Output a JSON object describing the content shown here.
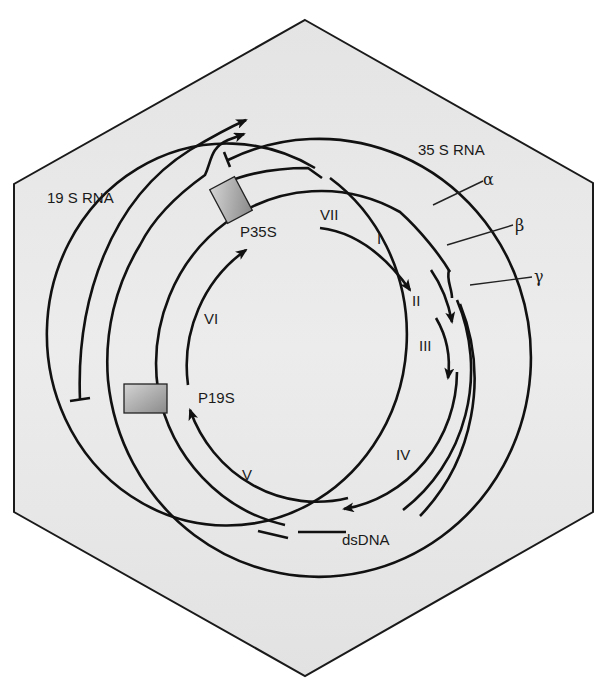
{
  "figure": {
    "capsid_shape": "hexagon",
    "colors": {
      "capsid_fill": "#e6e6e6",
      "capsid_stroke": "#1a1a1a",
      "strand": "#111111",
      "promoter_fill_light": "#d0d0d0",
      "promoter_fill_dark": "#8e8e8e"
    }
  },
  "transcripts": {
    "rna35s": "35 S RNA",
    "rna19s": "19 S RNA"
  },
  "promoters": {
    "p35s": "P35S",
    "p19s": "P19S"
  },
  "strands": {
    "alpha": "α",
    "beta": "β",
    "gamma": "γ",
    "dsdna": "dsDNA"
  },
  "orfs": [
    {
      "id": "VII",
      "label": "VII"
    },
    {
      "id": "I",
      "label": "I"
    },
    {
      "id": "II",
      "label": "II"
    },
    {
      "id": "III",
      "label": "III"
    },
    {
      "id": "IV",
      "label": "IV"
    },
    {
      "id": "V",
      "label": "V"
    },
    {
      "id": "VI",
      "label": "VI"
    }
  ]
}
